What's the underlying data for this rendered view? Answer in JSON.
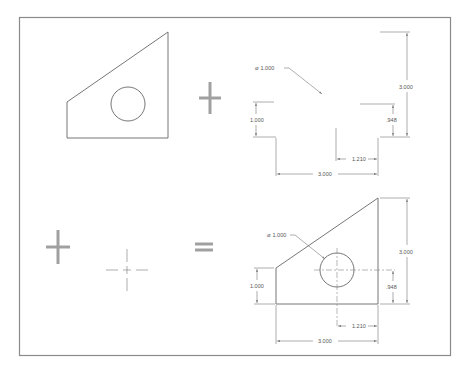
{
  "colors": {
    "background": "#ffffff",
    "frame": "#8a8a8a",
    "part_outline": "#666666",
    "dimension_lines": "#777777",
    "operators": "#a0a0a0",
    "text": "#555555"
  },
  "panels": {
    "shape": {
      "label": "Part outline with hole"
    },
    "operator_plus_1": {
      "symbol": "plus"
    },
    "dimensions": {
      "hole_diameter": "⌀ 1.000",
      "left_height": "1.000",
      "overall_height": "3.000",
      "hole_height": ".948",
      "hole_offset": "1.210",
      "overall_width": "3.000"
    },
    "operator_plus_2": {
      "symbol": "plus"
    },
    "center_mark": {
      "label": "Center mark"
    },
    "operator_equals": {
      "symbol": "equals"
    },
    "result": {
      "hole_diameter": "⌀ 1.000",
      "left_height": "1.000",
      "overall_height": "3.000",
      "hole_height": ".948",
      "hole_offset": "1.210",
      "overall_width": "3.000"
    }
  }
}
